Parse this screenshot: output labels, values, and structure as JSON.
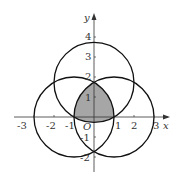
{
  "diagram": {
    "type": "coordinate-geometry",
    "axes": {
      "x_label": "x",
      "y_label": "y",
      "origin_label": "O",
      "x_ticks": [
        "-3",
        "-2",
        "-1",
        "1",
        "2",
        "3"
      ],
      "y_ticks": [
        "4",
        "3",
        "2",
        "1",
        "-1",
        "-2"
      ]
    },
    "circles": [
      {
        "center": [
          -1,
          0
        ],
        "radius": 2
      },
      {
        "center": [
          1,
          0
        ],
        "radius": 2
      },
      {
        "center": [
          0,
          1.732
        ],
        "radius": 2
      }
    ],
    "shaded_region": {
      "vertices": [
        [
          -1,
          0
        ],
        [
          1,
          0
        ],
        [
          0,
          1.732
        ]
      ],
      "fill": "#a6a6a6"
    },
    "colors": {
      "stroke": "#111111",
      "axis": "#333333"
    }
  }
}
